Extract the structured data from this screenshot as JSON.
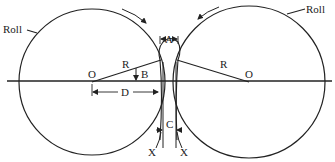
{
  "diagram": {
    "labels": {
      "roll_left": "Roll",
      "roll_right": "Roll",
      "center_left": "O",
      "center_right": "O",
      "radius_left": "R",
      "radius_right": "R",
      "angle": "B",
      "entry_width": "A",
      "exit_gap": "C",
      "distance": "D",
      "section_left": "X",
      "section_right": "X"
    },
    "colors": {
      "stroke": "#222222",
      "background": "#ffffff"
    }
  }
}
